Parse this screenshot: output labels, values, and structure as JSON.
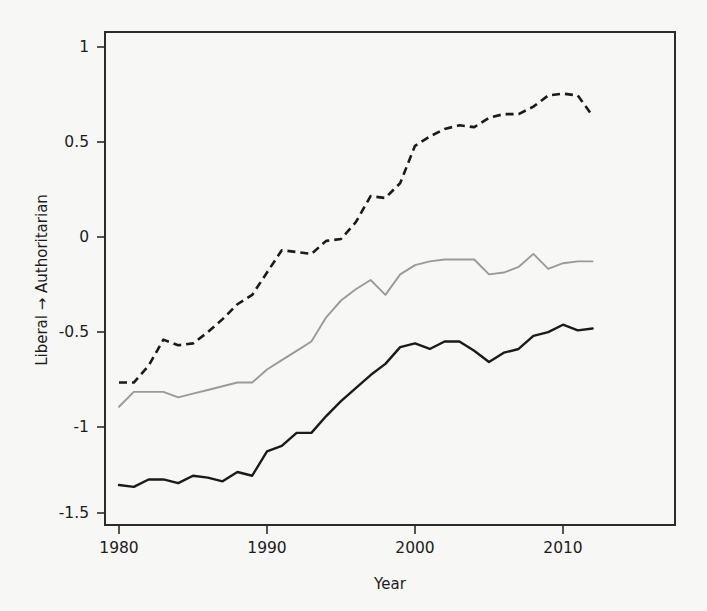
{
  "chart_data": {
    "type": "line",
    "title": "",
    "xlabel": "Year",
    "ylabel": "Liberal → Authoritarian",
    "xlim": [
      1979,
      2013
    ],
    "ylim": [
      -1.58,
      1.12
    ],
    "grid": false,
    "legend": "none",
    "xticks": [
      1980,
      1990,
      2000,
      2010
    ],
    "xtick_labels": [
      "1980",
      "1990",
      "2000",
      "2010"
    ],
    "yticks": [
      1,
      0.5,
      0,
      -0.5,
      -1,
      -1.5
    ],
    "ytick_labels": [
      "1",
      "0.5",
      "0",
      "-0.5",
      "-1",
      "-1.5"
    ],
    "x": [
      1980,
      1981,
      1982,
      1983,
      1984,
      1985,
      1986,
      1987,
      1988,
      1989,
      1990,
      1991,
      1992,
      1993,
      1994,
      1995,
      1996,
      1997,
      1998,
      1999,
      2000,
      2001,
      2002,
      2003,
      2004,
      2005,
      2006,
      2007,
      2008,
      2009,
      2010,
      2011,
      2012
    ],
    "series": [
      {
        "name": "dashed-black-series",
        "style": "dashed",
        "color": "#1a1a1a",
        "values": [
          -0.8,
          -0.8,
          -0.71,
          -0.57,
          -0.6,
          -0.59,
          -0.53,
          -0.46,
          -0.38,
          -0.33,
          -0.21,
          -0.09,
          -0.1,
          -0.11,
          -0.04,
          -0.03,
          0.06,
          0.2,
          0.19,
          0.27,
          0.47,
          0.52,
          0.56,
          0.58,
          0.57,
          0.62,
          0.64,
          0.64,
          0.68,
          0.74,
          0.75,
          0.74,
          0.63
        ]
      },
      {
        "name": "solid-gray-series",
        "style": "solid",
        "color": "#9a9a9a",
        "values": [
          -0.93,
          -0.85,
          -0.85,
          -0.85,
          -0.88,
          -0.86,
          -0.84,
          -0.82,
          -0.8,
          -0.8,
          -0.73,
          -0.68,
          -0.63,
          -0.58,
          -0.45,
          -0.36,
          -0.3,
          -0.25,
          -0.33,
          -0.22,
          -0.17,
          -0.15,
          -0.14,
          -0.14,
          -0.14,
          -0.22,
          -0.21,
          -0.18,
          -0.11,
          -0.19,
          -0.16,
          -0.15,
          -0.15
        ]
      },
      {
        "name": "solid-black-series",
        "style": "solid",
        "color": "#1a1a1a",
        "values": [
          -1.35,
          -1.36,
          -1.32,
          -1.32,
          -1.34,
          -1.3,
          -1.31,
          -1.33,
          -1.28,
          -1.3,
          -1.17,
          -1.14,
          -1.07,
          -1.07,
          -0.98,
          -0.9,
          -0.83,
          -0.76,
          -0.7,
          -0.61,
          -0.59,
          -0.62,
          -0.58,
          -0.58,
          -0.63,
          -0.69,
          -0.64,
          -0.62,
          -0.55,
          -0.53,
          -0.49,
          -0.52,
          -0.51
        ]
      }
    ]
  }
}
